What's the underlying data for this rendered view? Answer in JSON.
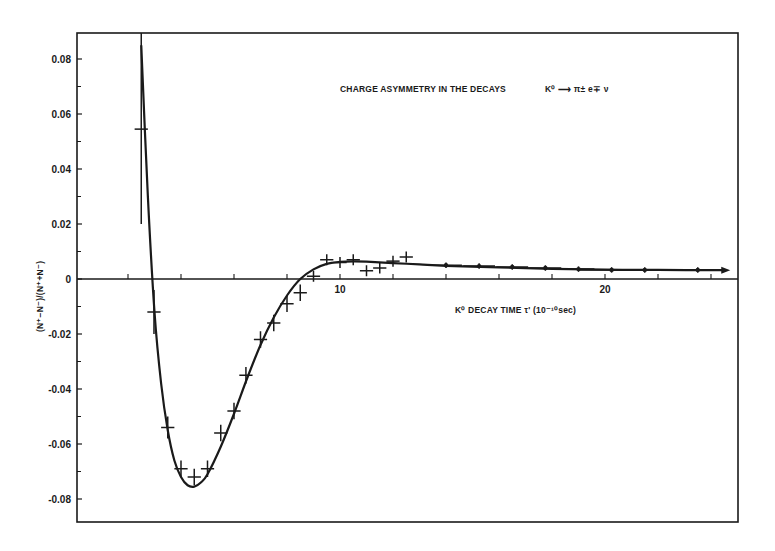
{
  "chart_data": {
    "type": "scatter",
    "title": "CHARGE ASYMMETRY IN THE DECAYS  K⁰ ⟶ π± e∓ ν",
    "title_main": "CHARGE ASYMMETRY IN THE DECAYS",
    "title_reaction": "K⁰ ⟶ π± e∓ ν",
    "xlabel": "K⁰ DECAY TIME τ' (10⁻¹⁰sec)",
    "ylabel": "(N⁺−N⁻)/(N⁺+N⁻)",
    "xlim": [
      0,
      25
    ],
    "ylim": [
      -0.09,
      0.09
    ],
    "x_ticks": [
      2,
      4,
      6,
      8,
      10,
      12,
      14,
      16,
      18,
      20,
      22,
      24
    ],
    "x_tick_labels": [
      "10",
      "20"
    ],
    "x_tick_label_values": [
      10,
      20
    ],
    "y_ticks": [
      0.08,
      0.06,
      0.04,
      0.02,
      0,
      -0.02,
      -0.04,
      -0.06,
      -0.08
    ],
    "y_tick_labels": [
      "0.08",
      "0.06",
      "0.04",
      "0.02",
      "0",
      "-0.02",
      "-0.04",
      "-0.06",
      "-0.08"
    ],
    "grid": false,
    "legend": null,
    "series": [
      {
        "name": "Measured asymmetry",
        "style": "crosses with error bars",
        "x": [
          2.5,
          2.98,
          3.5,
          4.0,
          4.5,
          5.0,
          5.5,
          6.0,
          6.45,
          7.0,
          7.5,
          8.0,
          8.5,
          9.0,
          9.5,
          10.0,
          10.5,
          11.0,
          11.5,
          12.0,
          12.5,
          14.0,
          15.25,
          16.5,
          17.75,
          19.0,
          20.25,
          21.5,
          23.5
        ],
        "y": [
          0.0545,
          -0.012,
          -0.054,
          -0.069,
          -0.072,
          -0.069,
          -0.056,
          -0.048,
          -0.035,
          -0.022,
          -0.016,
          -0.009,
          -0.005,
          0.001,
          0.007,
          0.006,
          0.007,
          0.003,
          0.004,
          0.0065,
          0.008,
          0.005,
          0.0047,
          0.0044,
          0.004,
          0.0036,
          0.0033,
          0.0033,
          0.0033
        ],
        "yerr_low": [
          0.0345,
          0.008,
          0.004,
          0.003,
          0.003,
          0.003,
          0.003,
          0.003,
          0.003,
          0.003,
          0.003,
          0.003,
          0.003,
          0.002,
          0.002,
          0.002,
          0.002,
          0.002,
          0.002,
          0.002,
          0.002,
          0.001,
          0.001,
          0.001,
          0.001,
          0.001,
          0.001,
          0.001,
          0.001
        ],
        "yerr_high": [
          0.035,
          0.008,
          0.004,
          0.003,
          0.003,
          0.003,
          0.003,
          0.003,
          0.003,
          0.003,
          0.003,
          0.003,
          0.003,
          0.002,
          0.002,
          0.002,
          0.002,
          0.002,
          0.002,
          0.002,
          0.002,
          0.001,
          0.001,
          0.001,
          0.001,
          0.001,
          0.001,
          0.001,
          0.001
        ],
        "xerr": [
          0.25,
          0.25,
          0.25,
          0.25,
          0.25,
          0.25,
          0.25,
          0.25,
          0.25,
          0.25,
          0.25,
          0.25,
          0.25,
          0.25,
          0.25,
          0.25,
          0.25,
          0.25,
          0.25,
          0.25,
          0.25,
          0.6,
          0.6,
          0.6,
          0.6,
          0.6,
          1.25,
          1.25,
          0.6
        ]
      },
      {
        "name": "Fitted curve",
        "style": "solid line",
        "x": [
          2.5,
          2.75,
          3.0,
          3.25,
          3.5,
          3.75,
          4.0,
          4.25,
          4.5,
          4.75,
          5.0,
          5.5,
          6.0,
          6.5,
          7.0,
          7.5,
          8.0,
          8.5,
          9.0,
          9.5,
          10.0,
          10.5,
          11.0,
          12.0,
          13.0,
          14.0,
          16.0,
          18.0,
          20.0,
          22.0,
          24.5
        ],
        "y": [
          0.085,
          0.03,
          -0.012,
          -0.038,
          -0.055,
          -0.066,
          -0.072,
          -0.075,
          -0.0755,
          -0.074,
          -0.071,
          -0.061,
          -0.049,
          -0.036,
          -0.024,
          -0.014,
          -0.006,
          0.0,
          0.0035,
          0.0055,
          0.0062,
          0.0064,
          0.0063,
          0.0058,
          0.0053,
          0.0048,
          0.0042,
          0.0037,
          0.0034,
          0.0033,
          0.0032
        ]
      }
    ],
    "annotations": [
      {
        "text": "arrow at end of zero-line tail",
        "x": 24.5,
        "y": 0.0032
      }
    ]
  }
}
